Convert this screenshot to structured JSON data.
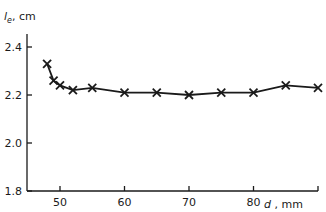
{
  "chart_data": {
    "type": "line",
    "title": "",
    "xlabel": "d, mm",
    "ylabel": "l_e, cm",
    "xlabel_var": "d",
    "xlabel_unit": "mm",
    "ylabel_var": "l",
    "ylabel_sub": "e",
    "ylabel_unit": "cm",
    "xlim": [
      45.4,
      90
    ],
    "ylim": [
      1.8,
      2.5
    ],
    "xticks": [
      50,
      60,
      70,
      80,
      90
    ],
    "xtick_labels": [
      "50",
      "60",
      "70",
      "80",
      ""
    ],
    "yticks": [
      1.8,
      2.0,
      2.2,
      2.4
    ],
    "ytick_labels": [
      "1.8",
      "2.0",
      "2.2",
      "2.4"
    ],
    "grid": false,
    "legend": null,
    "marker": "x",
    "series": [
      {
        "name": "l_e",
        "x": [
          48,
          49,
          50,
          52,
          55,
          60,
          65,
          70,
          75,
          80,
          85,
          90
        ],
        "values": [
          2.33,
          2.26,
          2.24,
          2.22,
          2.23,
          2.21,
          2.21,
          2.2,
          2.21,
          2.21,
          2.24,
          2.23
        ]
      }
    ]
  }
}
